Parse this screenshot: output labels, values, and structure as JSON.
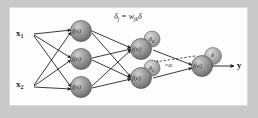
{
  "figure": {
    "title_formula": {
      "delta": "δ",
      "sub_j": "j",
      "equals": "=",
      "w": "w",
      "sub_jk": "jk",
      "delta2": "δ",
      "full": "δj = wjkδ"
    },
    "inputs": [
      {
        "symbol": "x",
        "subscript": "1"
      },
      {
        "symbol": "x",
        "subscript": "2"
      }
    ],
    "hidden_layer_1": [
      {
        "label": "f(e)"
      },
      {
        "label": "f(e)"
      },
      {
        "label": "f(e)"
      }
    ],
    "hidden_layer_2": [
      {
        "label": "f(e)",
        "badge": "δ",
        "badge_sub": "4"
      },
      {
        "label": "f(e)",
        "badge": "δ",
        "badge_sub": "5"
      }
    ],
    "output_layer": [
      {
        "label": "f(e)",
        "badge": "δ",
        "badge_sub": ""
      }
    ],
    "backprop_arrow": {
      "weight_label": "w",
      "weight_sub": "46"
    },
    "output": {
      "label": "y"
    },
    "colors": {
      "page_background": "#c9c9c9",
      "panel_background": "#fdfdfd",
      "panel_border": "#dcdcdc",
      "node_fill_light": "#b9b9b9",
      "node_fill_dark": "#6f6f6f",
      "node_stroke": "#555555",
      "edge": "#1a1a1a",
      "text": "#1a1a1a"
    }
  }
}
